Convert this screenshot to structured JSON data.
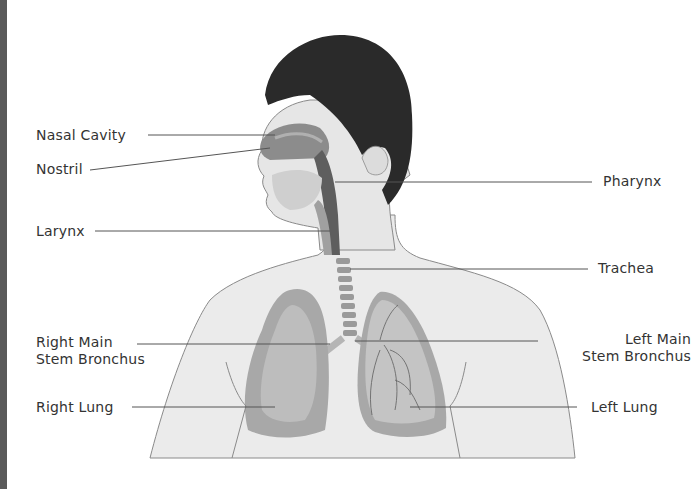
{
  "diagram": {
    "labels": {
      "nasal_cavity": "Nasal Cavity",
      "nostril": "Nostril",
      "larynx": "Larynx",
      "pharynx": "Pharynx",
      "trachea": "Trachea",
      "right_main_stem_bronchus_1": "Right Main",
      "right_main_stem_bronchus_2": "Stem Bronchus",
      "left_main_stem_bronchus_1": "Left Main",
      "left_main_stem_bronchus_2": "Stem Bronchus",
      "right_lung": "Right Lung",
      "left_lung": "Left Lung"
    },
    "colors": {
      "hair": "#2a2a2a",
      "skin": "#e8e8e8",
      "outline": "#8a8a8a",
      "lung_outer": "#a8a8a8",
      "lung_inner": "#bdbdbd",
      "airway": "#6e6e6e",
      "leader_line": "#555555",
      "text": "#333333"
    }
  }
}
